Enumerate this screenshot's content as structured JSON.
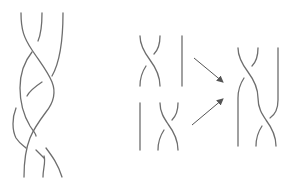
{
  "figure": {
    "description": "Braid diagrams: a three-strand braid on the left; on the right two elementary crossings (sigma1, sigma2) composed via arrows into a product braid.",
    "colors": {
      "stroke": "#6e6e6e",
      "arrow": "#555555",
      "background": "#ffffff"
    },
    "panels": [
      {
        "id": "long-braid",
        "strands": 3,
        "label": ""
      },
      {
        "id": "sigma-1",
        "strands": 3,
        "label": ""
      },
      {
        "id": "sigma-2",
        "strands": 3,
        "label": ""
      },
      {
        "id": "product-braid",
        "strands": 3,
        "label": ""
      }
    ],
    "arrows": 2
  }
}
